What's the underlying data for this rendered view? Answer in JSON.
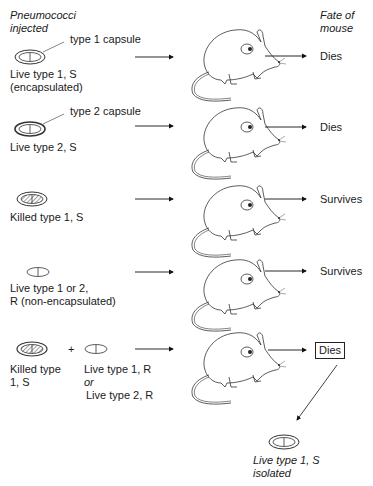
{
  "headers": {
    "left_line1": "Pneumococci",
    "left_line2": "injected",
    "right_line1": "Fate of",
    "right_line2": "mouse"
  },
  "rows": [
    {
      "callout": "type 1 capsule",
      "label_line1": "Live type 1, S",
      "label_line2": "(encapsulated)",
      "fate": "Dies",
      "bacterium": "encapsulated-live"
    },
    {
      "callout": "type 2 capsule",
      "label_line1": "Live type 2, S",
      "label_line2": "",
      "fate": "Dies",
      "bacterium": "encapsulated-live"
    },
    {
      "label_line1": "Killed type 1, S",
      "fate": "Survives",
      "bacterium": "encapsulated-killed"
    },
    {
      "label_line1": "Live type 1 or 2,",
      "label_line2": "R (non-encapsulated)",
      "fate": "Survives",
      "bacterium": "non-encapsulated"
    },
    {
      "label_a_line1": "Killed type",
      "label_a_line2": "1, S",
      "plus": "+",
      "label_b_line1": "Live type 1, R",
      "label_b_or": "or",
      "label_b_line2": "Live type 2, R",
      "fate": "Dies",
      "fate_boxed": true
    }
  ],
  "result": {
    "label_line1": "Live type 1, S",
    "label_line2": "isolated"
  }
}
